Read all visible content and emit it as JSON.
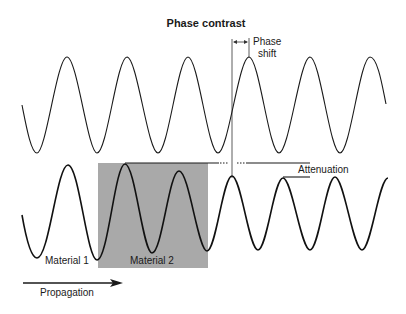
{
  "title": "Phase contrast",
  "labels": {
    "phase_shift_line1": "Phase",
    "phase_shift_line2": "shift",
    "attenuation": "Attenuation",
    "material_1": "Material 1",
    "material_2": "Material 2",
    "propagation": "Propagation"
  },
  "colors": {
    "background": "#ffffff",
    "stroke": "#1a1a1a",
    "material_2_fill": "#a9a9a9"
  },
  "waves": {
    "reference": {
      "description": "Top wave: unaltered reference wave",
      "start": [
        22,
        105
      ],
      "end": [
        386,
        104
      ],
      "period_px": 60.5,
      "peak_y": 57,
      "trough_y": 153
    },
    "through_material": {
      "description": "Bottom wave: wave passing through Material 1 then Material 2, attenuated and phase-shifted",
      "points": [
        [
          22,
          215
        ],
        [
          37,
          258
        ],
        [
          68,
          165
        ],
        [
          97,
          260
        ],
        [
          125,
          164
        ],
        [
          152,
          253
        ],
        [
          179,
          171
        ],
        [
          207,
          251
        ],
        [
          232,
          176
        ],
        [
          258,
          250
        ],
        [
          283,
          178
        ],
        [
          310,
          250
        ],
        [
          335,
          177
        ],
        [
          362,
          250
        ],
        [
          388,
          178
        ]
      ]
    }
  },
  "material_2_box": {
    "x": 98,
    "y": 163,
    "width": 110,
    "height": 105
  }
}
